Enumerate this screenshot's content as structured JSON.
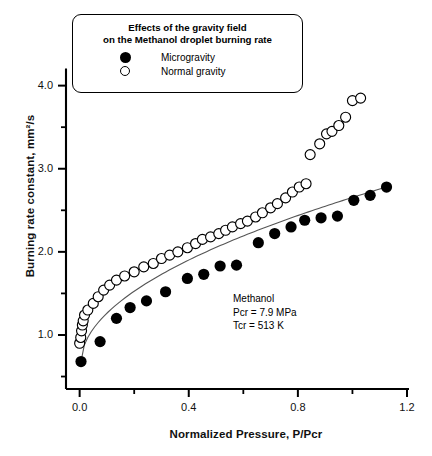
{
  "chart_data": {
    "type": "scatter",
    "title": "Effects of the gravity field on the Methanol droplet burning rate",
    "xlabel": "Normalized Pressure, P/Pcr",
    "ylabel": "Burning rate constant, mm²/s",
    "xlim": [
      -0.05,
      1.2
    ],
    "ylim": [
      0.35,
      4.2
    ],
    "xticks": [
      "0.0",
      "0.4",
      "0.8",
      "1.2"
    ],
    "xtick_values": [
      0.0,
      0.4,
      0.8,
      1.2
    ],
    "xminor_values": [
      0.2,
      0.6,
      1.0
    ],
    "yticks": [
      "1.0",
      "2.0",
      "3.0",
      "4.0"
    ],
    "ytick_values": [
      1.0,
      2.0,
      3.0,
      4.0
    ],
    "yminor_values": [
      0.5,
      1.5,
      2.5,
      3.5
    ],
    "grid": false,
    "legend_position": "top-center",
    "annotation": [
      "Methanol",
      "Pcr = 7.9 MPa",
      "Tcr = 513 K"
    ],
    "series": [
      {
        "name": "Microgravity",
        "marker": "filled-circle",
        "color": "#000000",
        "points": [
          [
            0.005,
            0.68
          ],
          [
            0.075,
            0.92
          ],
          [
            0.135,
            1.2
          ],
          [
            0.185,
            1.33
          ],
          [
            0.245,
            1.41
          ],
          [
            0.315,
            1.52
          ],
          [
            0.395,
            1.68
          ],
          [
            0.455,
            1.73
          ],
          [
            0.515,
            1.83
          ],
          [
            0.575,
            1.84
          ],
          [
            0.655,
            2.11
          ],
          [
            0.715,
            2.22
          ],
          [
            0.775,
            2.3
          ],
          [
            0.825,
            2.38
          ],
          [
            0.885,
            2.41
          ],
          [
            0.945,
            2.43
          ],
          [
            1.005,
            2.62
          ],
          [
            1.065,
            2.68
          ],
          [
            1.125,
            2.78
          ]
        ],
        "fit_line": true
      },
      {
        "name": "Normal gravity",
        "marker": "open-circle",
        "color": "#000000",
        "points": [
          [
            0.0,
            0.9
          ],
          [
            0.004,
            0.97
          ],
          [
            0.007,
            1.05
          ],
          [
            0.01,
            1.12
          ],
          [
            0.013,
            1.17
          ],
          [
            0.018,
            1.24
          ],
          [
            0.03,
            1.3
          ],
          [
            0.05,
            1.38
          ],
          [
            0.068,
            1.46
          ],
          [
            0.088,
            1.54
          ],
          [
            0.11,
            1.6
          ],
          [
            0.135,
            1.66
          ],
          [
            0.165,
            1.71
          ],
          [
            0.2,
            1.76
          ],
          [
            0.235,
            1.82
          ],
          [
            0.27,
            1.86
          ],
          [
            0.3,
            1.92
          ],
          [
            0.33,
            1.96
          ],
          [
            0.36,
            2.0
          ],
          [
            0.395,
            2.05
          ],
          [
            0.425,
            2.1
          ],
          [
            0.45,
            2.15
          ],
          [
            0.48,
            2.18
          ],
          [
            0.51,
            2.22
          ],
          [
            0.535,
            2.26
          ],
          [
            0.56,
            2.3
          ],
          [
            0.59,
            2.34
          ],
          [
            0.615,
            2.37
          ],
          [
            0.645,
            2.42
          ],
          [
            0.67,
            2.47
          ],
          [
            0.7,
            2.53
          ],
          [
            0.725,
            2.58
          ],
          [
            0.755,
            2.65
          ],
          [
            0.78,
            2.72
          ],
          [
            0.805,
            2.78
          ],
          [
            0.83,
            2.82
          ],
          [
            0.845,
            3.17
          ],
          [
            0.88,
            3.3
          ],
          [
            0.905,
            3.42
          ],
          [
            0.925,
            3.45
          ],
          [
            0.95,
            3.52
          ],
          [
            0.975,
            3.62
          ],
          [
            1.0,
            3.82
          ],
          [
            1.03,
            3.85
          ]
        ],
        "fit_line": false
      }
    ]
  },
  "legend": {
    "title_line1": "Effects of the gravity field",
    "title_line2": "on the Methanol droplet burning rate",
    "items": [
      {
        "label": "Microgravity",
        "marker": "filled-circle"
      },
      {
        "label": "Normal gravity",
        "marker": "open-circle"
      }
    ]
  },
  "annotation": {
    "line1": "Methanol",
    "line2": "Pcr = 7.9 MPa",
    "line3": "Tcr = 513 K"
  },
  "caption": {
    "text": ""
  }
}
